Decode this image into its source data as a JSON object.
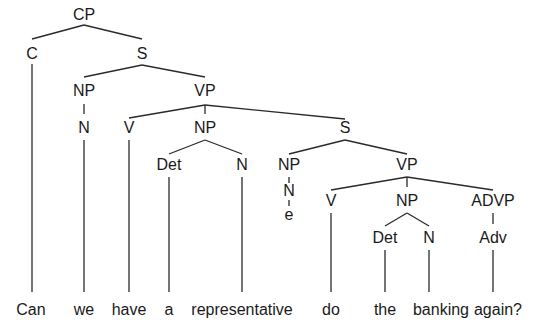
{
  "diagram": {
    "type": "syntax-tree",
    "sentence": "Can we have a representative do the banking again?",
    "nodes": [
      {
        "id": "cp",
        "label": "CP",
        "x": 84,
        "y": 14
      },
      {
        "id": "c",
        "label": "C",
        "x": 32,
        "y": 53
      },
      {
        "id": "s1",
        "label": "S",
        "x": 142,
        "y": 53
      },
      {
        "id": "np1",
        "label": "NP",
        "x": 84,
        "y": 90
      },
      {
        "id": "vp1",
        "label": "VP",
        "x": 205,
        "y": 90
      },
      {
        "id": "n1",
        "label": "N",
        "x": 84,
        "y": 127
      },
      {
        "id": "v1",
        "label": "V",
        "x": 129,
        "y": 127
      },
      {
        "id": "np2",
        "label": "NP",
        "x": 205,
        "y": 127
      },
      {
        "id": "s2",
        "label": "S",
        "x": 345,
        "y": 127
      },
      {
        "id": "det1",
        "label": "Det",
        "x": 169,
        "y": 164
      },
      {
        "id": "n2",
        "label": "N",
        "x": 242,
        "y": 164
      },
      {
        "id": "np3",
        "label": "NP",
        "x": 289,
        "y": 164
      },
      {
        "id": "vp2",
        "label": "VP",
        "x": 407,
        "y": 164
      },
      {
        "id": "n3",
        "label": "N",
        "x": 289,
        "y": 190
      },
      {
        "id": "e",
        "label": "e",
        "x": 289,
        "y": 214
      },
      {
        "id": "v2",
        "label": "V",
        "x": 331,
        "y": 200
      },
      {
        "id": "np4",
        "label": "NP",
        "x": 407,
        "y": 200
      },
      {
        "id": "advp",
        "label": "ADVP",
        "x": 493,
        "y": 200
      },
      {
        "id": "det2",
        "label": "Det",
        "x": 385,
        "y": 237
      },
      {
        "id": "n4",
        "label": "N",
        "x": 429,
        "y": 237
      },
      {
        "id": "adv",
        "label": "Adv",
        "x": 493,
        "y": 237
      }
    ],
    "words": [
      {
        "text": "Can",
        "x": 31
      },
      {
        "text": "we",
        "x": 84
      },
      {
        "text": "have",
        "x": 129
      },
      {
        "text": "a",
        "x": 169
      },
      {
        "text": "representative",
        "x": 242
      },
      {
        "text": "do",
        "x": 331
      },
      {
        "text": "the",
        "x": 385
      },
      {
        "text": "banking",
        "x": 441
      },
      {
        "text": "again?",
        "x": 498
      }
    ],
    "word_y": 309
  }
}
